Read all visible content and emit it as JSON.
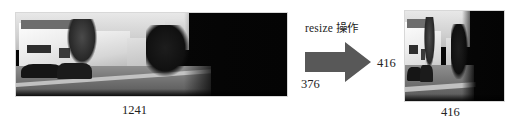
{
  "figure": {
    "background_color": "#ffffff"
  },
  "source_image": {
    "name": "original-street-photo",
    "alt": "grayscale street scene with houses, parked cars and road",
    "width_label": "1241",
    "height_label": "376"
  },
  "operation": {
    "arrow_label": "resize 操作",
    "arrow_color": "#585858",
    "arrow_direction": "right"
  },
  "result_image": {
    "name": "resized-street-photo",
    "alt": "grayscale street scene squeezed to a square",
    "width_label": "416",
    "height_label": "416"
  }
}
